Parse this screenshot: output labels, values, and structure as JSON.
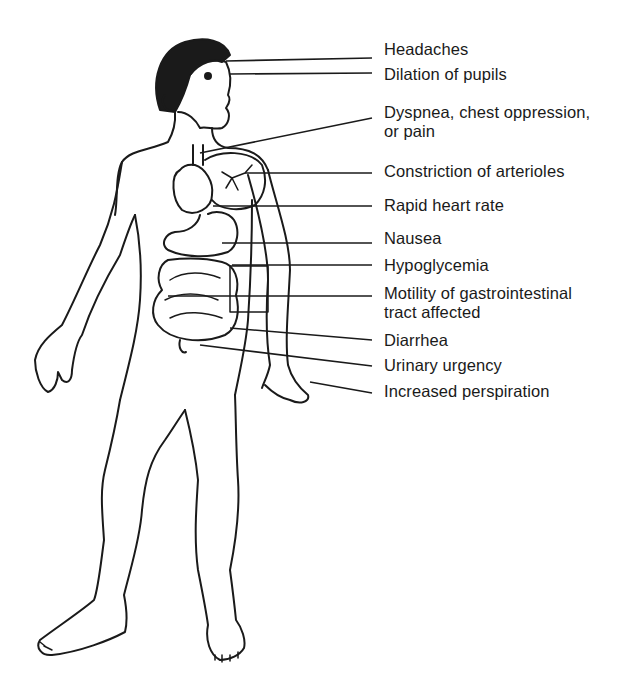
{
  "diagram": {
    "line_color": "#1a1a1a",
    "labels": [
      {
        "id": "headaches",
        "text": "Headaches",
        "top": 40,
        "line": {
          "x1": 226,
          "y1": 61,
          "x2": 372,
          "y2": 58
        }
      },
      {
        "id": "pupils",
        "text": "Dilation of pupils",
        "top": 65,
        "line": {
          "x1": 230,
          "y1": 74,
          "x2": 372,
          "y2": 73
        }
      },
      {
        "id": "dyspnea",
        "lines": [
          "Dyspnea, chest oppression,",
          "or pain"
        ],
        "top": 103,
        "line": {
          "x1": 200,
          "y1": 153,
          "x2": 372,
          "y2": 118
        }
      },
      {
        "id": "arterioles",
        "text": "Constriction of arterioles",
        "top": 162,
        "line": {
          "x1": 245,
          "y1": 173,
          "x2": 372,
          "y2": 173
        }
      },
      {
        "id": "heart",
        "text": "Rapid heart rate",
        "top": 196,
        "line": {
          "x1": 213,
          "y1": 206,
          "x2": 372,
          "y2": 206
        }
      },
      {
        "id": "nausea",
        "text": "Nausea",
        "top": 229,
        "line": {
          "x1": 222,
          "y1": 243,
          "x2": 372,
          "y2": 243
        }
      },
      {
        "id": "hypoglycemia",
        "text": "Hypoglycemia",
        "top": 256,
        "line": {
          "x1": 232,
          "y1": 265,
          "x2": 372,
          "y2": 265
        }
      },
      {
        "id": "motility",
        "lines": [
          "Motility of gastrointestinal",
          "tract affected"
        ],
        "top": 284,
        "line": {
          "x1": 168,
          "y1": 296,
          "x2": 372,
          "y2": 296
        }
      },
      {
        "id": "diarrhea",
        "text": "Diarrhea",
        "top": 331,
        "line": {
          "x1": 230,
          "y1": 328,
          "x2": 372,
          "y2": 340
        }
      },
      {
        "id": "urinary",
        "text": "Urinary urgency",
        "top": 356,
        "line": {
          "x1": 200,
          "y1": 345,
          "x2": 372,
          "y2": 366
        }
      },
      {
        "id": "perspiration",
        "text": "Increased perspiration",
        "top": 382,
        "line": {
          "x1": 310,
          "y1": 382,
          "x2": 372,
          "y2": 393
        }
      }
    ]
  }
}
